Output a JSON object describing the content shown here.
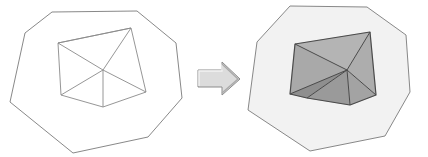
{
  "figure": {
    "background_color": "#ffffff",
    "width": 428,
    "height": 157
  },
  "colors": {
    "outline_stroke": "#7a7a7a",
    "inner_stroke_left": "#8a8a8a",
    "inner_stroke_right": "#4a4a4a",
    "outer_fill_left": "#ffffff",
    "outer_fill_right": "#f2f2f2",
    "arrow_fill": "#dcdcdc",
    "arrow_stroke": "#8c8c8c",
    "arrow_highlight": "#f0f0f0",
    "arrow_shadow": "#a9a9a9",
    "triangle_shades": [
      "#a9a9a9",
      "#b4b4b4",
      "#adadad",
      "#9a9a9a",
      "#8f8f8f",
      "#a3a3a3"
    ]
  },
  "left_panel": {
    "label": "Unshaded triangulated polygon",
    "outer_polygon": {
      "name": "outer-polygon-left",
      "points": "52,12 137,11 176,43 182,98 148,137 73,153 10,102 25,33",
      "fill": "#ffffff",
      "stroke": "#7a7a7a",
      "stroke_width": 0.9
    },
    "inner_polygon": {
      "name": "inner-hexagon-left",
      "points": "58,43 131,28 146,92 103,107 61,95",
      "fill": "none",
      "stroke": "#8a8a8a",
      "stroke_width": 0.9
    },
    "center_point": {
      "x": 103,
      "y": 70
    },
    "diagonals": [
      {
        "name": "diagonal-to-top-left",
        "x1": 103,
        "y1": 70,
        "x2": 58,
        "y2": 43
      },
      {
        "name": "diagonal-to-top-right",
        "x1": 103,
        "y1": 70,
        "x2": 131,
        "y2": 28
      },
      {
        "name": "diagonal-to-right",
        "x1": 103,
        "y1": 70,
        "x2": 146,
        "y2": 92
      },
      {
        "name": "diagonal-to-bottom",
        "x1": 103,
        "y1": 70,
        "x2": 103,
        "y2": 107
      },
      {
        "name": "diagonal-to-left",
        "x1": 103,
        "y1": 70,
        "x2": 61,
        "y2": 95
      },
      {
        "name": "chord-top-edge",
        "x1": 58,
        "y1": 43,
        "x2": 131,
        "y2": 28
      }
    ]
  },
  "arrow": {
    "name": "transformation-arrow",
    "label": "transforms into",
    "body_points": "198,70 222,70 222,62 240,79 222,95 222,87 198,87",
    "fill": "#dcdcdc",
    "stroke": "#8c8c8c",
    "stroke_width": 1
  },
  "right_panel": {
    "label": "Shaded triangulated polygon",
    "outer_polygon": {
      "name": "outer-polygon-right",
      "points": "290,6 367,7 406,35 410,92 385,136 310,151 248,110 257,42",
      "fill": "#f2f2f2",
      "stroke": "#7a7a7a",
      "stroke_width": 0.9
    },
    "center_point": {
      "x": 347,
      "y": 70
    },
    "triangles": [
      {
        "name": "triangle-upper-left",
        "points": "295,44 370,32 347,70",
        "fill": "#b4b4b4"
      },
      {
        "name": "triangle-left",
        "points": "295,44 347,70 290,94",
        "fill": "#a9a9a9"
      },
      {
        "name": "triangle-lower-left",
        "points": "290,94 347,70 307,98",
        "fill": "#8f8f8f"
      },
      {
        "name": "triangle-lower-middle",
        "points": "307,98 347,70 350,105",
        "fill": "#9a9a9a"
      },
      {
        "name": "triangle-lower-right",
        "points": "350,105 347,70 376,95",
        "fill": "#a3a3a3"
      },
      {
        "name": "triangle-upper-right",
        "points": "376,95 347,70 370,32",
        "fill": "#adadad"
      }
    ],
    "inner_polygon": {
      "name": "inner-hexagon-right",
      "points": "295,44 370,32 376,95 350,105 307,98 290,94",
      "fill": "none",
      "stroke": "#4a4a4a",
      "stroke_width": 1.2
    },
    "diagonals": [
      {
        "name": "diagonal-to-top-left",
        "x1": 347,
        "y1": 70,
        "x2": 295,
        "y2": 44
      },
      {
        "name": "diagonal-to-top-right",
        "x1": 347,
        "y1": 70,
        "x2": 370,
        "y2": 32
      },
      {
        "name": "diagonal-to-right",
        "x1": 347,
        "y1": 70,
        "x2": 376,
        "y2": 95
      },
      {
        "name": "diagonal-to-bottom",
        "x1": 347,
        "y1": 70,
        "x2": 350,
        "y2": 105
      },
      {
        "name": "diagonal-to-bottom-left",
        "x1": 347,
        "y1": 70,
        "x2": 307,
        "y2": 98
      },
      {
        "name": "diagonal-to-left",
        "x1": 347,
        "y1": 70,
        "x2": 290,
        "y2": 94
      }
    ]
  }
}
